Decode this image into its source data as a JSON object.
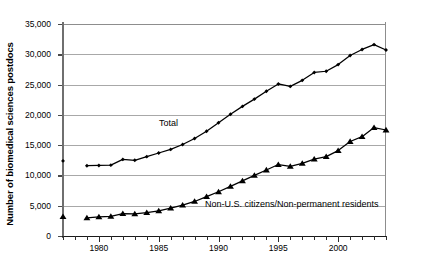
{
  "chart_data": {
    "type": "line",
    "title": "",
    "subtitle": "",
    "xlabel": "",
    "ylabel": "Number of biomedical sciences postdocs",
    "xlim": [
      1977,
      2004
    ],
    "ylim": [
      0,
      35000
    ],
    "grid": true,
    "legend_position": "inline-annotations",
    "y_ticks": [
      0,
      5000,
      10000,
      15000,
      20000,
      25000,
      30000,
      35000
    ],
    "y_tick_labels": [
      "0",
      "5,000",
      "10,000",
      "15,000",
      "20,000",
      "25,000",
      "30,000",
      "35,000"
    ],
    "x_ticks": [
      1977,
      1978,
      1979,
      1980,
      1981,
      1982,
      1983,
      1984,
      1985,
      1986,
      1987,
      1988,
      1989,
      1990,
      1991,
      1992,
      1993,
      1994,
      1995,
      1996,
      1997,
      1998,
      1999,
      2000,
      2001,
      2002,
      2003,
      2004
    ],
    "x_tick_labels_shown": [
      "1980",
      "1985",
      "1990",
      "1995",
      "2000"
    ],
    "x_major_ticks": [
      1980,
      1985,
      1990,
      1995,
      2000
    ],
    "annotations": [
      {
        "text": "Total",
        "x": 1985,
        "y": 16200
      },
      {
        "text": "Non-U.S. citizens/Non-permanent residents",
        "x": 1990,
        "y": 3100
      }
    ],
    "series": [
      {
        "name": "Total",
        "marker": "diamond",
        "color": "#000000",
        "x": [
          1977,
          1979,
          1980,
          1981,
          1982,
          1983,
          1984,
          1985,
          1986,
          1987,
          1988,
          1989,
          1990,
          1991,
          1992,
          1993,
          1994,
          1995,
          1996,
          1997,
          1998,
          1999,
          2000,
          2001,
          2002,
          2003,
          2004
        ],
        "values": [
          12400,
          11600,
          11650,
          11700,
          12650,
          12500,
          13100,
          13700,
          14300,
          15100,
          16100,
          17300,
          18700,
          20100,
          21400,
          22600,
          23900,
          25100,
          24700,
          25700,
          27000,
          27200,
          28300,
          29800,
          30800,
          31600,
          30700
        ]
      },
      {
        "name": "Non-U.S. citizens/Non-permanent residents",
        "marker": "triangle",
        "color": "#000000",
        "x": [
          1977,
          1979,
          1980,
          1981,
          1982,
          1983,
          1984,
          1985,
          1986,
          1987,
          1988,
          1989,
          1990,
          1991,
          1992,
          1993,
          1994,
          1995,
          1996,
          1997,
          1998,
          1999,
          2000,
          2001,
          2002,
          2003,
          2004
        ],
        "values": [
          3200,
          3000,
          3150,
          3250,
          3700,
          3650,
          3850,
          4150,
          4600,
          5100,
          5700,
          6500,
          7300,
          8200,
          9100,
          10000,
          10900,
          11800,
          11500,
          12000,
          12700,
          13100,
          14100,
          15600,
          16400,
          17900,
          17500
        ]
      }
    ]
  }
}
